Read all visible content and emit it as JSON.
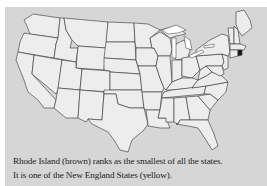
{
  "map": {
    "title": "Map of the contiguous United States",
    "highlighted_state": "Rhode Island",
    "colors": {
      "background_panel": "#d6d6d6",
      "state_fill": "#ededed",
      "state_border": "#333333",
      "lakes": "#ffffff",
      "rhode_island": "#1a1a1a",
      "page": "#ffffff"
    }
  },
  "caption": {
    "line1": "Rhode Island (brown) ranks as the smallest of all the states.",
    "line2": "It is one of the New England States (yellow)."
  }
}
